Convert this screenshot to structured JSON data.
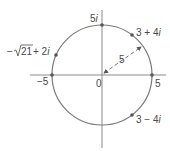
{
  "diagram": {
    "type": "complex-plane-circle",
    "circle": {
      "center": [
        0,
        0
      ],
      "radius": 5
    },
    "labels": {
      "origin": "0",
      "neg_real": "−5",
      "pos_real": "5",
      "pos_imag": "5",
      "pos_imag_unit": "i",
      "radius": "5",
      "p1_re": "3 + 4",
      "p1_unit": "i",
      "p2_re": "3 − 4",
      "p2_unit": "i",
      "p3_prefix": "−",
      "p3_radicand": "21",
      "p3_suffix": " + 2",
      "p3_unit": "i"
    },
    "points": [
      {
        "label": "5i",
        "re": 0,
        "im": 5
      },
      {
        "label": "3 + 4i",
        "re": 3,
        "im": 4
      },
      {
        "label": "−√21 + 2i",
        "re": -4.583,
        "im": 2
      },
      {
        "label": "−5",
        "re": -5,
        "im": 0
      },
      {
        "label": "5",
        "re": 5,
        "im": 0
      },
      {
        "label": "3 − 4i",
        "re": 3,
        "im": -4
      }
    ],
    "colors": {
      "axis": "#8a8a8a",
      "circle": "#7a7a7a",
      "point": "#555555",
      "text": "#4a4a4a"
    }
  }
}
